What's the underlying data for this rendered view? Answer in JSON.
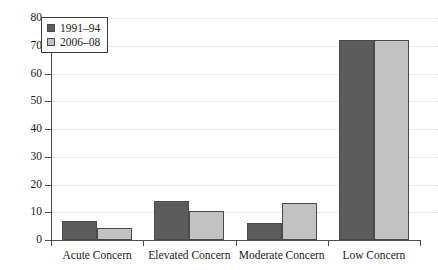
{
  "chart_data": {
    "type": "bar",
    "title": "",
    "subtitle": "",
    "xlabel": "",
    "ylabel": "",
    "categories": [
      "Acute Concern",
      "Elevated Concern",
      "Moderate Concern",
      "Low Concern"
    ],
    "series": [
      {
        "name": "1991–94",
        "color": "#5c5c5c",
        "values": [
          7,
          14,
          6.3,
          72
        ]
      },
      {
        "name": "2006–08",
        "color": "#c2c2c2",
        "values": [
          4.5,
          10.3,
          13.5,
          72
        ]
      }
    ],
    "ylim": [
      0,
      80
    ],
    "ytick_values": [
      0,
      10,
      20,
      30,
      40,
      50,
      60,
      70,
      80
    ],
    "ytick_labels": [
      "0",
      "10",
      "20",
      "30",
      "40",
      "50",
      "60",
      "70",
      "80"
    ],
    "grid": true,
    "grid_axis": "y",
    "grid_style": "dotted",
    "legend_position": "top-left",
    "annotations": []
  }
}
